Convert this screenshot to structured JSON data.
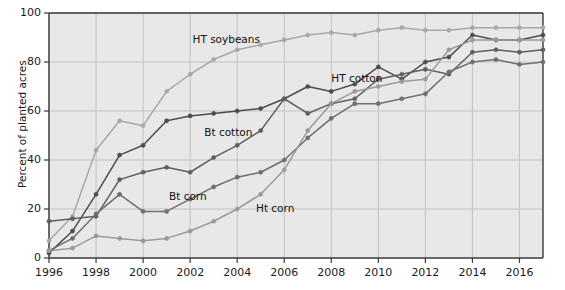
{
  "chart_data": {
    "type": "line",
    "title": "",
    "xlabel": "",
    "ylabel": "Percent of planted acres",
    "xlim": [
      1996,
      2017
    ],
    "ylim": [
      0,
      100
    ],
    "grid": true,
    "legend_position": "inline-annotations",
    "x": [
      1996,
      1997,
      1998,
      1999,
      2000,
      2001,
      2002,
      2003,
      2004,
      2005,
      2006,
      2007,
      2008,
      2009,
      2010,
      2011,
      2012,
      2013,
      2014,
      2015,
      2016,
      2017
    ],
    "xticks": [
      "1996",
      "1998",
      "2000",
      "2002",
      "2004",
      "2006",
      "2008",
      "2010",
      "2012",
      "2014",
      "2016"
    ],
    "xtick_values": [
      1996,
      1998,
      2000,
      2002,
      2004,
      2006,
      2008,
      2010,
      2012,
      2014,
      2016
    ],
    "yticks": [
      "0",
      "20",
      "40",
      "60",
      "80",
      "100"
    ],
    "ytick_values": [
      0,
      20,
      40,
      60,
      80,
      100
    ],
    "series": [
      {
        "name": "HT soybeans",
        "color": "#a8a8a8",
        "label_x": 2002.1,
        "label_y": 89,
        "values": [
          7,
          17,
          44,
          56,
          54,
          68,
          75,
          81,
          85,
          87,
          89,
          91,
          92,
          91,
          93,
          94,
          93,
          93,
          94,
          94,
          94,
          94
        ]
      },
      {
        "name": "HT cotton",
        "color": "#4d4d4d",
        "label_x": 2008.0,
        "label_y": 73,
        "values": [
          2,
          11,
          26,
          42,
          46,
          56,
          58,
          59,
          60,
          61,
          65,
          70,
          68,
          71,
          78,
          73,
          80,
          82,
          91,
          89,
          89,
          91
        ]
      },
      {
        "name": "Bt cotton",
        "color": "#5f5f5f",
        "label_x": 2002.6,
        "label_y": 51,
        "values": [
          15,
          16,
          17,
          32,
          35,
          37,
          35,
          41,
          46,
          52,
          65,
          59,
          63,
          65,
          73,
          75,
          77,
          75,
          84,
          85,
          84,
          85
        ]
      },
      {
        "name": "Bt corn",
        "color": "#6f6f6f",
        "label_x": 2001.1,
        "label_y": 25,
        "values": [
          3,
          8,
          18,
          26,
          19,
          19,
          24,
          29,
          33,
          35,
          40,
          49,
          57,
          63,
          63,
          65,
          67,
          76,
          80,
          81,
          79,
          80
        ]
      },
      {
        "name": "Ht corn",
        "color": "#9a9a9a",
        "label_x": 2004.8,
        "label_y": 20,
        "values": [
          3,
          4,
          9,
          8,
          7,
          8,
          11,
          15,
          20,
          26,
          36,
          52,
          63,
          68,
          70,
          72,
          73,
          85,
          89,
          89,
          89,
          89
        ]
      }
    ]
  },
  "style": {
    "plot_background": "#e8e8e8",
    "grid_color": "#c2c2c2",
    "axis_color": "#3a3a3a",
    "text_color": "#1a1a1a"
  }
}
